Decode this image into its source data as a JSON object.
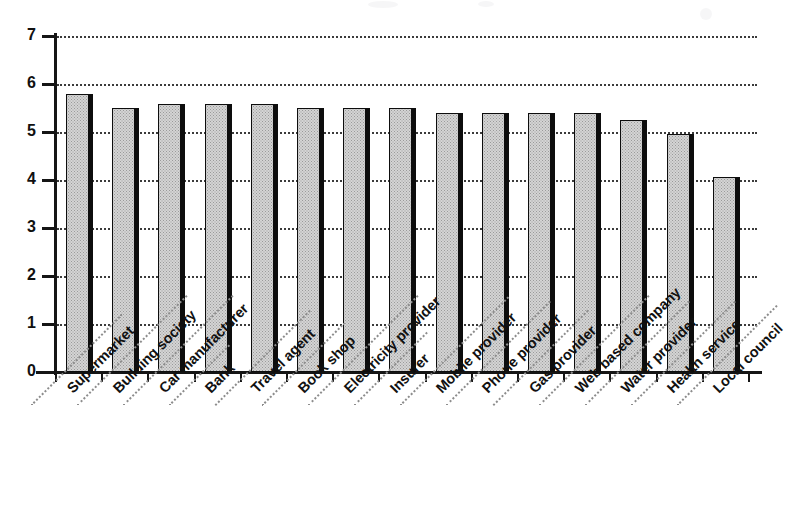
{
  "chart_data": {
    "type": "bar",
    "title": "",
    "subtitle": "",
    "xlabel": "",
    "ylabel": "",
    "ylim": [
      0,
      7
    ],
    "yticks": [
      0,
      1,
      2,
      3,
      4,
      5,
      6,
      7
    ],
    "ytick_labels": [
      "0",
      "1",
      "2",
      "3",
      "4",
      "5",
      "6",
      "7"
    ],
    "grid": "horizontal-dotted",
    "legend": "none",
    "orientation": "vertical",
    "bar_style": {
      "fill": "#d4d4d4",
      "fill_pattern": "stipple-dots",
      "outline": "#0d0d0d",
      "shadow": "#0d0d0d"
    },
    "categories": [
      "Supermarket",
      "Building society",
      "Car manufacturer",
      "Bank",
      "Travel agent",
      "Book shop",
      "Electricity provider",
      "Insurer",
      "Mobile provider",
      "Phone provider",
      "Gas provider",
      "Web based company",
      "Water provider",
      "Health service",
      "Local council"
    ],
    "values": [
      5.8,
      5.5,
      5.58,
      5.58,
      5.58,
      5.5,
      5.5,
      5.5,
      5.4,
      5.4,
      5.4,
      5.4,
      5.25,
      4.95,
      4.07
    ]
  }
}
